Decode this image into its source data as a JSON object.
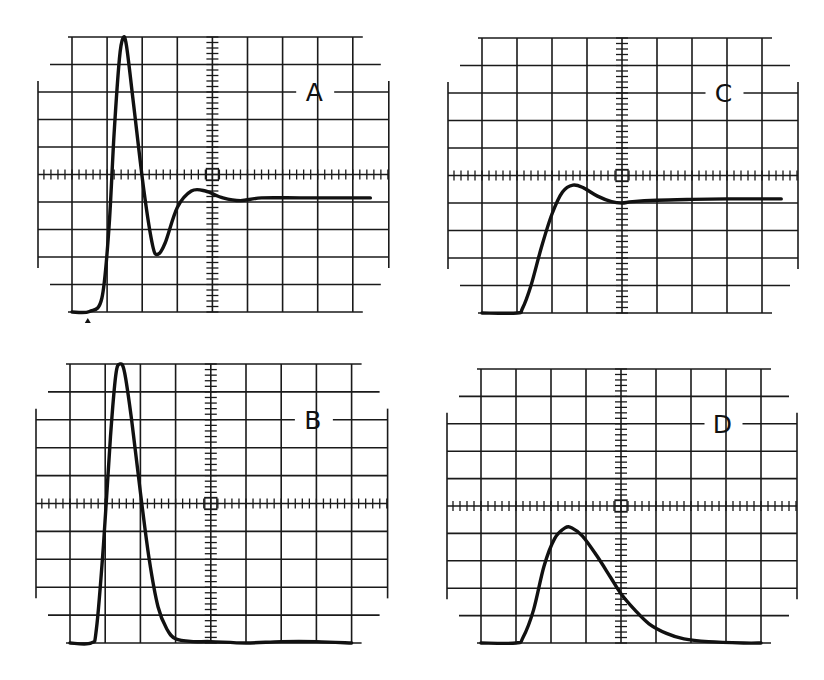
{
  "figure": {
    "ink_color": "#111111",
    "background": "#ffffff"
  },
  "graticule": {
    "columns": 8,
    "rows": 10,
    "minor_ticks_per_division": 5
  },
  "panels": [
    {
      "id": "A",
      "label": "A",
      "origin": [
        72,
        37
      ],
      "cell": [
        35.1,
        27.5
      ],
      "label_pos": [
        6.9,
        2.0
      ],
      "trigger_marker": true,
      "trace": [
        [
          0,
          10
        ],
        [
          0.5,
          9.98
        ],
        [
          0.85,
          9.5
        ],
        [
          1.05,
          7.0
        ],
        [
          1.2,
          3.5
        ],
        [
          1.35,
          0.8
        ],
        [
          1.45,
          0.05
        ],
        [
          1.55,
          0.3
        ],
        [
          1.75,
          2.4
        ],
        [
          2.05,
          5.6
        ],
        [
          2.3,
          7.6
        ],
        [
          2.45,
          7.9
        ],
        [
          2.65,
          7.5
        ],
        [
          3.0,
          6.2
        ],
        [
          3.4,
          5.6
        ],
        [
          3.8,
          5.6
        ],
        [
          4.3,
          5.85
        ],
        [
          4.8,
          5.95
        ],
        [
          5.4,
          5.85
        ],
        [
          6.5,
          5.85
        ],
        [
          7.6,
          5.85
        ],
        [
          8.5,
          5.85
        ]
      ]
    },
    {
      "id": "C",
      "label": "C",
      "origin": [
        482,
        38
      ],
      "cell": [
        35.0,
        27.5
      ],
      "label_pos": [
        6.9,
        2.0
      ],
      "trigger_marker": false,
      "trace": [
        [
          0,
          10
        ],
        [
          1.0,
          10
        ],
        [
          1.15,
          9.85
        ],
        [
          1.4,
          9.0
        ],
        [
          1.7,
          7.6
        ],
        [
          2.0,
          6.4
        ],
        [
          2.3,
          5.6
        ],
        [
          2.6,
          5.35
        ],
        [
          2.9,
          5.45
        ],
        [
          3.3,
          5.75
        ],
        [
          3.7,
          5.95
        ],
        [
          4.0,
          6.0
        ],
        [
          4.3,
          5.95
        ],
        [
          5.0,
          5.9
        ],
        [
          6.0,
          5.87
        ],
        [
          7.0,
          5.85
        ],
        [
          8.0,
          5.85
        ],
        [
          8.55,
          5.85
        ]
      ]
    },
    {
      "id": "B",
      "label": "B",
      "origin": [
        70,
        364
      ],
      "cell": [
        35.2,
        27.9
      ],
      "label_pos": [
        6.9,
        2.0
      ],
      "trigger_marker": false,
      "trace": [
        [
          0,
          10
        ],
        [
          0.6,
          10
        ],
        [
          0.75,
          9.5
        ],
        [
          0.95,
          6.5
        ],
        [
          1.15,
          2.6
        ],
        [
          1.3,
          0.4
        ],
        [
          1.42,
          0
        ],
        [
          1.55,
          0.3
        ],
        [
          1.75,
          2.0
        ],
        [
          2.0,
          4.6
        ],
        [
          2.25,
          7.0
        ],
        [
          2.5,
          8.7
        ],
        [
          2.75,
          9.5
        ],
        [
          3.0,
          9.85
        ],
        [
          3.5,
          9.95
        ],
        [
          4.0,
          9.95
        ],
        [
          5.0,
          10.0
        ],
        [
          6.0,
          9.95
        ],
        [
          7.0,
          9.95
        ],
        [
          8.0,
          10.0
        ]
      ]
    },
    {
      "id": "D",
      "label": "D",
      "origin": [
        481,
        369
      ],
      "cell": [
        35.0,
        27.4
      ],
      "label_pos": [
        6.9,
        2.0
      ],
      "trigger_marker": false,
      "trace": [
        [
          0,
          10
        ],
        [
          1.0,
          10
        ],
        [
          1.2,
          9.8
        ],
        [
          1.5,
          8.8
        ],
        [
          1.8,
          7.2
        ],
        [
          2.1,
          6.2
        ],
        [
          2.4,
          5.8
        ],
        [
          2.6,
          5.8
        ],
        [
          2.9,
          6.1
        ],
        [
          3.3,
          6.8
        ],
        [
          3.7,
          7.6
        ],
        [
          4.0,
          8.2
        ],
        [
          4.4,
          8.8
        ],
        [
          4.8,
          9.3
        ],
        [
          5.3,
          9.65
        ],
        [
          5.8,
          9.85
        ],
        [
          6.5,
          9.95
        ],
        [
          7.5,
          10
        ],
        [
          8.0,
          10
        ]
      ]
    }
  ]
}
